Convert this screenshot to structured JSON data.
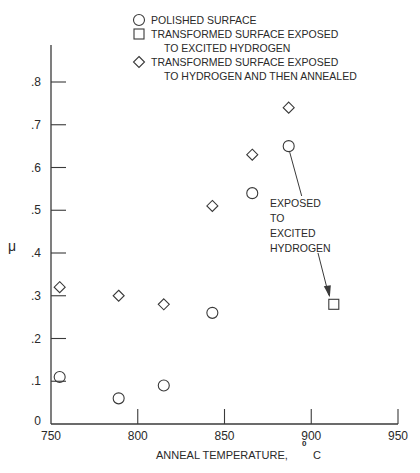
{
  "chart_data": {
    "type": "scatter",
    "title": "",
    "xlabel": "ANNEAL TEMPERATURE, °C",
    "xlabel_main": "ANNEAL TEMPERATURE,",
    "xlabel_degree": "0",
    "xlabel_unit": "C",
    "ylabel": "μ",
    "xlim": [
      750,
      950
    ],
    "ylim": [
      0,
      0.8
    ],
    "grid": false,
    "legend_position": "top",
    "x_ticks": [
      750,
      800,
      850,
      900,
      950
    ],
    "x_tick_labels": [
      "750",
      "800",
      "850",
      "900",
      "950"
    ],
    "y_ticks": [
      0,
      0.1,
      0.2,
      0.3,
      0.4,
      0.5,
      0.6,
      0.7,
      0.8
    ],
    "y_tick_labels": [
      "0",
      ".1",
      ".2",
      ".3",
      ".4",
      ".5",
      ".6",
      ".7",
      ".8"
    ],
    "legend": [
      {
        "marker": "circle",
        "lines": [
          "POLISHED SURFACE"
        ]
      },
      {
        "marker": "square",
        "lines": [
          "TRANSFORMED SURFACE EXPOSED",
          "TO EXCITED HYDROGEN"
        ]
      },
      {
        "marker": "diamond",
        "lines": [
          "TRANSFORMED SURFACE EXPOSED",
          "TO HYDROGEN AND THEN ANNEALED"
        ]
      }
    ],
    "series": [
      {
        "name": "POLISHED SURFACE",
        "marker": "circle",
        "x": [
          755,
          789,
          815,
          843,
          866,
          887
        ],
        "y": [
          0.11,
          0.06,
          0.09,
          0.26,
          0.54,
          0.65
        ]
      },
      {
        "name": "TRANSFORMED SURFACE EXPOSED TO EXCITED HYDROGEN",
        "marker": "square",
        "x": [
          913
        ],
        "y": [
          0.28
        ]
      },
      {
        "name": "TRANSFORMED SURFACE EXPOSED TO HYDROGEN AND THEN ANNEALED",
        "marker": "diamond",
        "x": [
          755,
          789,
          815,
          843,
          866,
          887
        ],
        "y": [
          0.32,
          0.3,
          0.28,
          0.51,
          0.63,
          0.74
        ]
      }
    ],
    "annotations": [
      {
        "lines": [
          "EXPOSED",
          "TO",
          "EXCITED",
          "HYDROGEN"
        ],
        "arrow_from": [
          887,
          0.65
        ],
        "arrow_to": [
          913,
          0.28
        ]
      }
    ]
  }
}
